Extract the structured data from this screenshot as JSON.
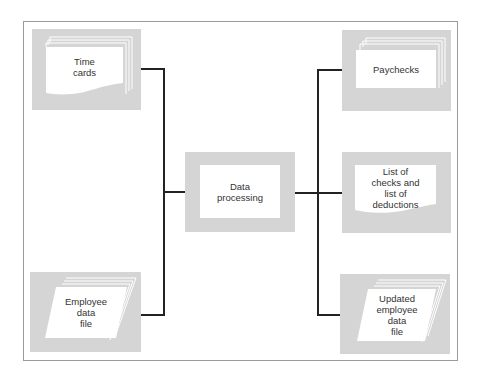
{
  "diagram": {
    "type": "flowchart",
    "title": "",
    "colors": {
      "node_fill": "#d5d5d5",
      "doc_fill": "#ffffff",
      "line": "#222222",
      "text": "#333333",
      "frame": "#9a9a9a"
    },
    "inputs": [
      {
        "id": "time-cards",
        "label": "Time\ncards",
        "shape": "stacked-document"
      },
      {
        "id": "employee-data-file",
        "label": "Employee\ndata\nfile",
        "shape": "stacked-parallelogram"
      }
    ],
    "process": {
      "id": "data-processing",
      "label": "Data\nprocessing",
      "shape": "rectangle"
    },
    "outputs": [
      {
        "id": "paychecks",
        "label": "Paychecks",
        "shape": "stacked-rectangle"
      },
      {
        "id": "list-of-checks",
        "label": "List of\nchecks and\nlist of\ndeductions",
        "shape": "document"
      },
      {
        "id": "updated-employee-data-file",
        "label": "Updated\nemployee\ndata\nfile",
        "shape": "stacked-parallelogram"
      }
    ],
    "edges": [
      {
        "from": "time-cards",
        "to": "data-processing"
      },
      {
        "from": "employee-data-file",
        "to": "data-processing"
      },
      {
        "from": "data-processing",
        "to": "paychecks"
      },
      {
        "from": "data-processing",
        "to": "list-of-checks"
      },
      {
        "from": "data-processing",
        "to": "updated-employee-data-file"
      }
    ]
  }
}
